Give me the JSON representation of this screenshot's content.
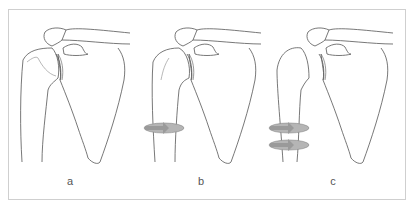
{
  "figure": {
    "panels": [
      {
        "id": "a",
        "label": "a",
        "rotation_arrows": 0,
        "description": "Shoulder joint (humerus, glenoid, scapula, clavicle) at rest"
      },
      {
        "id": "b",
        "label": "b",
        "rotation_arrows": 1,
        "description": "Humerus with one rotation arrow around shaft"
      },
      {
        "id": "c",
        "label": "c",
        "rotation_arrows": 2,
        "description": "Humerus with two rotation arrows around shaft"
      }
    ],
    "colors": {
      "line": "#555555",
      "arrow_fill": "#9a9a9a",
      "arrow_light": "#c4c4c4",
      "frame": "#cfcfcf"
    }
  }
}
